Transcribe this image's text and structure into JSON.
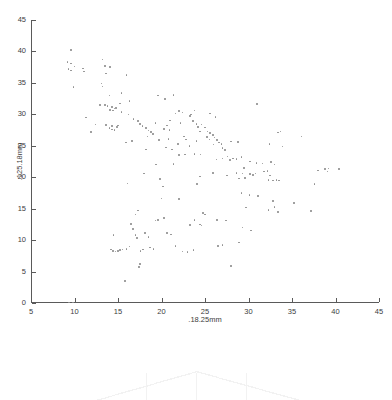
{
  "chart_data": {
    "type": "scatter",
    "title": "",
    "xlabel": ".18.25mm",
    "ylabel": ".125.18mm",
    "xlim": [
      5,
      45
    ],
    "ylim": [
      0,
      45
    ],
    "xticks": [
      5,
      10,
      15,
      20,
      25,
      30,
      35,
      40,
      45
    ],
    "yticks": [
      0,
      5,
      10,
      15,
      20,
      25,
      30,
      35,
      40,
      45
    ],
    "xticklabels": [
      "5",
      "10",
      "15",
      "20",
      "25",
      "30",
      "35",
      "40",
      "45"
    ],
    "yticklabels": [
      "0",
      "5",
      "10",
      "15",
      "20",
      "25",
      "30",
      "35",
      "40",
      "45"
    ],
    "grid": false,
    "legend": null,
    "marker": "dot",
    "marker_color": "#8d8d8d",
    "marker_size": 1.6,
    "axis_color": "#5a5a5a",
    "background": "#ffffff",
    "points": [
      [
        9.6,
        40.2
      ],
      [
        9.2,
        38.3
      ],
      [
        9.6,
        38.1
      ],
      [
        9.3,
        37.2
      ],
      [
        9.6,
        37.0
      ],
      [
        10.0,
        37.6
      ],
      [
        9.9,
        34.3
      ],
      [
        11.0,
        37.3
      ],
      [
        11.1,
        36.8
      ],
      [
        11.3,
        29.5
      ],
      [
        11.9,
        27.2
      ],
      [
        13.2,
        38.7
      ],
      [
        13.5,
        37.7
      ],
      [
        13.6,
        36.5
      ],
      [
        13.1,
        34.9
      ],
      [
        13.2,
        34.4
      ],
      [
        14.1,
        37.5
      ],
      [
        14.0,
        33.0
      ],
      [
        13.5,
        31.5
      ],
      [
        13.8,
        31.3
      ],
      [
        14.3,
        31.2
      ],
      [
        14.1,
        30.7
      ],
      [
        14.4,
        30.6
      ],
      [
        14.6,
        30.9
      ],
      [
        14.8,
        31.0
      ],
      [
        13.6,
        28.3
      ],
      [
        14.0,
        27.8
      ],
      [
        14.3,
        27.6
      ],
      [
        14.6,
        27.5
      ],
      [
        14.3,
        28.1
      ],
      [
        14.9,
        28.0
      ],
      [
        15.2,
        31.7
      ],
      [
        15.0,
        28.2
      ],
      [
        15.4,
        30.4
      ],
      [
        16.0,
        36.3
      ],
      [
        16.3,
        32.1
      ],
      [
        16.2,
        30.0
      ],
      [
        15.9,
        25.5
      ],
      [
        16.6,
        25.8
      ],
      [
        17.3,
        28.9
      ],
      [
        17.5,
        28.5
      ],
      [
        17.8,
        28.1
      ],
      [
        18.2,
        27.8
      ],
      [
        18.5,
        27.4
      ],
      [
        18.4,
        26.5
      ],
      [
        18.8,
        27.2
      ],
      [
        19.0,
        26.9
      ],
      [
        19.6,
        33.0
      ],
      [
        20.4,
        32.4
      ],
      [
        21.4,
        33.1
      ],
      [
        19.3,
        28.6
      ],
      [
        19.7,
        25.9
      ],
      [
        20.3,
        27.7
      ],
      [
        20.6,
        28.2
      ],
      [
        21.0,
        29.0
      ],
      [
        20.9,
        27.5
      ],
      [
        20.8,
        26.1
      ],
      [
        20.5,
        24.7
      ],
      [
        21.2,
        24.4
      ],
      [
        21.6,
        30.1
      ],
      [
        22.0,
        30.5
      ],
      [
        22.4,
        30.3
      ],
      [
        22.2,
        28.6
      ],
      [
        22.6,
        26.5
      ],
      [
        22.0,
        23.5
      ],
      [
        22.7,
        23.6
      ],
      [
        23.4,
        30.0
      ],
      [
        23.8,
        30.6
      ],
      [
        23.3,
        29.7
      ],
      [
        23.6,
        28.9
      ],
      [
        24.0,
        28.5
      ],
      [
        24.2,
        28.0
      ],
      [
        24.6,
        28.4
      ],
      [
        24.4,
        27.3
      ],
      [
        24.0,
        25.8
      ],
      [
        23.8,
        23.7
      ],
      [
        24.5,
        23.6
      ],
      [
        25.0,
        27.9
      ],
      [
        25.3,
        27.3
      ],
      [
        25.6,
        27.0
      ],
      [
        25.2,
        26.4
      ],
      [
        25.5,
        26.0
      ],
      [
        25.9,
        26.7
      ],
      [
        26.1,
        26.3
      ],
      [
        26.4,
        25.9
      ],
      [
        26.0,
        25.2
      ],
      [
        26.6,
        25.5
      ],
      [
        26.9,
        25.3
      ],
      [
        25.6,
        30.1
      ],
      [
        26.2,
        29.6
      ],
      [
        27.0,
        24.6
      ],
      [
        27.3,
        24.3
      ],
      [
        27.0,
        23.0
      ],
      [
        27.6,
        23.3
      ],
      [
        27.9,
        22.7
      ],
      [
        28.2,
        23.0
      ],
      [
        28.6,
        22.9
      ],
      [
        28.0,
        25.7
      ],
      [
        28.8,
        25.6
      ],
      [
        29.2,
        23.2
      ],
      [
        29.5,
        21.5
      ],
      [
        29.3,
        20.6
      ],
      [
        28.6,
        20.7
      ],
      [
        28.9,
        19.8
      ],
      [
        29.6,
        19.9
      ],
      [
        30.2,
        20.5
      ],
      [
        30.5,
        20.4
      ],
      [
        30.8,
        20.6
      ],
      [
        30.2,
        22.5
      ],
      [
        30.9,
        22.3
      ],
      [
        31.0,
        31.6
      ],
      [
        31.6,
        22.2
      ],
      [
        31.8,
        20.9
      ],
      [
        32.2,
        21.0
      ],
      [
        32.5,
        20.3
      ],
      [
        32.3,
        19.6
      ],
      [
        32.8,
        19.5
      ],
      [
        33.2,
        19.6
      ],
      [
        33.5,
        19.5
      ],
      [
        32.6,
        22.4
      ],
      [
        33.0,
        22.0
      ],
      [
        33.4,
        27.1
      ],
      [
        33.7,
        27.3
      ],
      [
        33.9,
        24.9
      ],
      [
        32.4,
        25.3
      ],
      [
        36.1,
        26.5
      ],
      [
        38.0,
        21.1
      ],
      [
        38.8,
        21.3
      ],
      [
        39.1,
        20.9
      ],
      [
        39.2,
        21.4
      ],
      [
        40.4,
        21.3
      ],
      [
        37.6,
        18.9
      ],
      [
        37.2,
        14.6
      ],
      [
        35.2,
        15.9
      ],
      [
        33.0,
        15.3
      ],
      [
        33.4,
        14.5
      ],
      [
        32.8,
        16.2
      ],
      [
        32.3,
        14.8
      ],
      [
        31.1,
        17.0
      ],
      [
        30.1,
        17.2
      ],
      [
        29.2,
        17.5
      ],
      [
        29.7,
        15.2
      ],
      [
        30.3,
        11.5
      ],
      [
        29.3,
        12.0
      ],
      [
        28.9,
        9.6
      ],
      [
        28.0,
        5.9
      ],
      [
        26.5,
        9.1
      ],
      [
        27.0,
        9.2
      ],
      [
        26.4,
        13.2
      ],
      [
        27.4,
        13.1
      ],
      [
        24.8,
        14.3
      ],
      [
        25.0,
        14.1
      ],
      [
        24.6,
        12.3
      ],
      [
        24.4,
        12.5
      ],
      [
        23.8,
        13.2
      ],
      [
        23.3,
        12.4
      ],
      [
        23.0,
        8.1
      ],
      [
        23.7,
        8.4
      ],
      [
        22.0,
        16.5
      ],
      [
        22.4,
        8.2
      ],
      [
        21.6,
        9.1
      ],
      [
        21.1,
        10.9
      ],
      [
        20.6,
        11.1
      ],
      [
        20.3,
        13.5
      ],
      [
        20.0,
        16.6
      ],
      [
        20.2,
        18.5
      ],
      [
        19.8,
        19.7
      ],
      [
        19.3,
        13.1
      ],
      [
        19.6,
        13.2
      ],
      [
        19.1,
        8.6
      ],
      [
        18.7,
        8.8
      ],
      [
        18.5,
        10.5
      ],
      [
        18.1,
        11.1
      ],
      [
        17.9,
        8.5
      ],
      [
        17.6,
        8.3
      ],
      [
        17.4,
        5.7
      ],
      [
        17.5,
        6.2
      ],
      [
        17.2,
        10.3
      ],
      [
        17.0,
        10.8
      ],
      [
        17.3,
        14.7
      ],
      [
        17.0,
        14.1
      ],
      [
        16.7,
        11.8
      ],
      [
        16.5,
        12.6
      ],
      [
        16.3,
        9.0
      ],
      [
        16.0,
        8.6
      ],
      [
        15.8,
        3.5
      ],
      [
        15.5,
        8.5
      ],
      [
        15.2,
        8.4
      ],
      [
        15.0,
        8.3
      ],
      [
        14.7,
        8.2
      ],
      [
        14.5,
        10.8
      ],
      [
        14.4,
        8.3
      ],
      [
        14.2,
        8.5
      ],
      [
        16.1,
        19.0
      ],
      [
        9.4,
        0.1
      ],
      [
        9.8,
        0.1
      ],
      [
        25.9,
        20.7
      ],
      [
        24.4,
        20.1
      ],
      [
        26.3,
        22.8
      ],
      [
        27.5,
        20.3
      ],
      [
        24.1,
        18.9
      ],
      [
        21.4,
        22.1
      ],
      [
        19.4,
        22.0
      ],
      [
        18.0,
        20.6
      ],
      [
        15.4,
        33.4
      ],
      [
        16.8,
        29.3
      ],
      [
        18.2,
        24.4
      ],
      [
        12.9,
        31.5
      ],
      [
        12.4,
        28.4
      ],
      [
        22.8,
        26.0
      ],
      [
        23.2,
        25.0
      ],
      [
        21.9,
        25.3
      ]
    ]
  },
  "subplot": {
    "visible": true,
    "description": "clipped-faint-tent-plot",
    "color": "#f2f2f2"
  }
}
